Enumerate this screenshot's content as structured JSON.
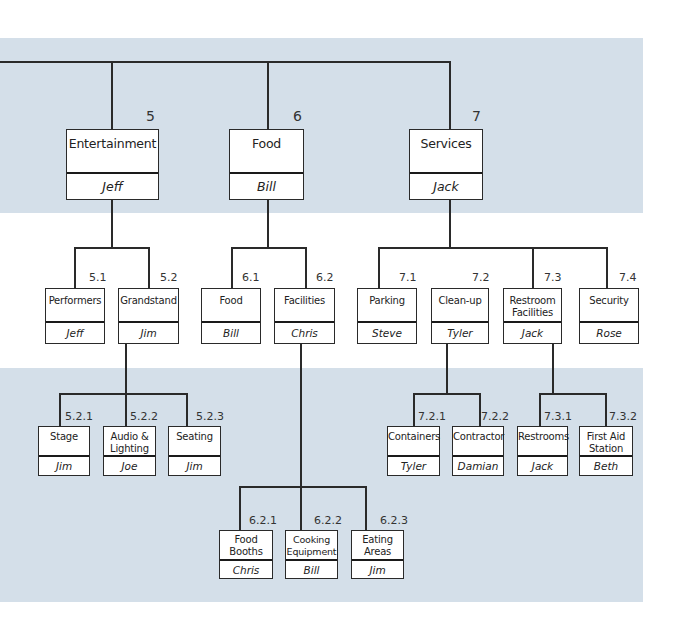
{
  "colors": {
    "band": "#d4dfe9",
    "line": "#2a2a2a",
    "box_bg": "#ffffff"
  },
  "level1": [
    {
      "id": "5",
      "name": "Entertainment",
      "owner": "Jeff"
    },
    {
      "id": "6",
      "name": "Food",
      "owner": "Bill"
    },
    {
      "id": "7",
      "name": "Services",
      "owner": "Jack"
    }
  ],
  "level2": [
    {
      "id": "5.1",
      "name": "Performers",
      "owner": "Jeff"
    },
    {
      "id": "5.2",
      "name": "Grandstand",
      "owner": "Jim"
    },
    {
      "id": "6.1",
      "name": "Food",
      "owner": "Bill"
    },
    {
      "id": "6.2",
      "name": "Facilities",
      "owner": "Chris"
    },
    {
      "id": "7.1",
      "name": "Parking",
      "owner": "Steve"
    },
    {
      "id": "7.2",
      "name": "Clean-up",
      "owner": "Tyler"
    },
    {
      "id": "7.3",
      "name": "Restroom Facilities",
      "owner": "Jack"
    },
    {
      "id": "7.4",
      "name": "Security",
      "owner": "Rose"
    }
  ],
  "level3": [
    {
      "id": "5.2.1",
      "name": "Stage",
      "owner": "Jim"
    },
    {
      "id": "5.2.2",
      "name": "Audio & Lighting",
      "owner": "Joe"
    },
    {
      "id": "5.2.3",
      "name": "Seating",
      "owner": "Jim"
    },
    {
      "id": "7.2.1",
      "name": "Containers",
      "owner": "Tyler"
    },
    {
      "id": "7.2.2",
      "name": "Contractor",
      "owner": "Damian"
    },
    {
      "id": "7.3.1",
      "name": "Restrooms",
      "owner": "Jack"
    },
    {
      "id": "7.3.2",
      "name": "First Aid Station",
      "owner": "Beth"
    },
    {
      "id": "6.2.1",
      "name": "Food Booths",
      "owner": "Chris"
    },
    {
      "id": "6.2.2",
      "name": "Cooking Equipment",
      "owner": "Bill"
    },
    {
      "id": "6.2.3",
      "name": "Eating Areas",
      "owner": "Jim"
    }
  ]
}
